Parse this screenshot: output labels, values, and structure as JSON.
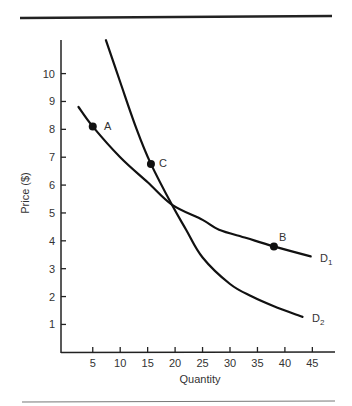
{
  "chart_data": {
    "type": "line",
    "title": "",
    "xlabel": "Quantity",
    "ylabel": "Price ($)",
    "xlim": [
      0,
      48
    ],
    "ylim": [
      0,
      11
    ],
    "x_ticks": [
      5,
      10,
      15,
      20,
      25,
      30,
      35,
      40,
      45
    ],
    "y_ticks": [
      1,
      2,
      3,
      4,
      5,
      6,
      7,
      8,
      9,
      10
    ],
    "grid": false,
    "legend": "none (curves labeled directly)",
    "series": [
      {
        "name": "D1",
        "label_main": "D",
        "label_sub": "1",
        "points": [
          [
            2.4,
            8.8
          ],
          [
            5,
            8.1
          ],
          [
            10,
            7.0
          ],
          [
            15,
            6.1
          ],
          [
            19.4,
            5.3
          ],
          [
            25,
            4.75
          ],
          [
            28,
            4.4
          ],
          [
            33,
            4.1
          ],
          [
            38,
            3.8
          ],
          [
            44.7,
            3.44
          ]
        ]
      },
      {
        "name": "D2",
        "label_main": "D",
        "label_sub": "2",
        "points": [
          [
            7.4,
            11.2
          ],
          [
            10,
            9.7
          ],
          [
            13,
            8.0
          ],
          [
            15.6,
            6.76
          ],
          [
            19.4,
            5.3
          ],
          [
            22,
            4.4
          ],
          [
            25,
            3.4
          ],
          [
            30,
            2.45
          ],
          [
            34,
            2.0
          ],
          [
            38,
            1.65
          ],
          [
            43.2,
            1.27
          ]
        ]
      }
    ],
    "annotations": [
      {
        "label": "A",
        "x": 5,
        "y": 8.1,
        "curve": "D1"
      },
      {
        "label": "B",
        "x": 38,
        "y": 3.8,
        "curve": "D1"
      },
      {
        "label": "C",
        "x": 15.6,
        "y": 6.76,
        "curve": "D2"
      }
    ],
    "intersection": {
      "x": 19.4,
      "y": 5.3
    }
  },
  "figure": {
    "xlabel": "Quantity",
    "ylabel": "Price ($)",
    "x_tick_labels": [
      "5",
      "10",
      "15",
      "20",
      "25",
      "30",
      "35",
      "40",
      "45"
    ],
    "y_tick_labels": [
      "1",
      "2",
      "3",
      "4",
      "5",
      "6",
      "7",
      "8",
      "9",
      "10"
    ],
    "point_labels": {
      "a": "A",
      "b": "B",
      "c": "C"
    },
    "curve_labels": {
      "d1_main": "D",
      "d1_sub": "1",
      "d2_main": "D",
      "d2_sub": "2"
    },
    "colors": {
      "curve": "#111111",
      "axis": "#222222",
      "text": "#333333",
      "top_rule": "#222222",
      "bottom_rule": "#666666"
    }
  }
}
